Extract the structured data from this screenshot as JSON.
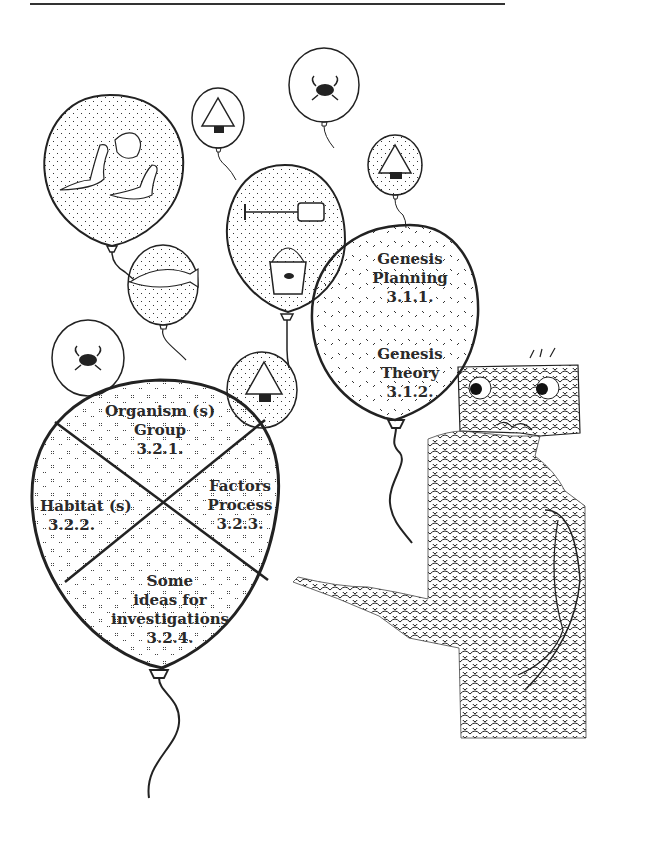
{
  "page": {
    "rule_color": "#333333",
    "ink_color": "#222222"
  },
  "balloons": {
    "genesis": {
      "planning": {
        "title_line1": "Genesis",
        "title_line2": "Planning",
        "code": "3.1.1."
      },
      "theory": {
        "title_line1": "Genesis",
        "title_line2": "Theory",
        "code": "3.1.2."
      }
    },
    "divided": {
      "organism": {
        "line1": "Organism (s)",
        "line2": "Group",
        "code": "3.2.1."
      },
      "habitat": {
        "line1": "Habitat (s)",
        "code": "3.2.2."
      },
      "factors": {
        "line1": "Factors",
        "line2": "Process",
        "code": "3.2.3."
      },
      "ideas": {
        "line1": "Some",
        "line2": "ideas for",
        "line3": "investigations",
        "code": "3.2.4."
      }
    },
    "small_icons": [
      "lizards-icon",
      "triangle-creature-icon",
      "crab-icon",
      "triangle-creature-icon",
      "bucket-and-spade-icon",
      "fish-icon",
      "crab-icon",
      "triangle-creature-icon"
    ]
  },
  "character": {
    "description": "alien creature pointing at balloons"
  }
}
